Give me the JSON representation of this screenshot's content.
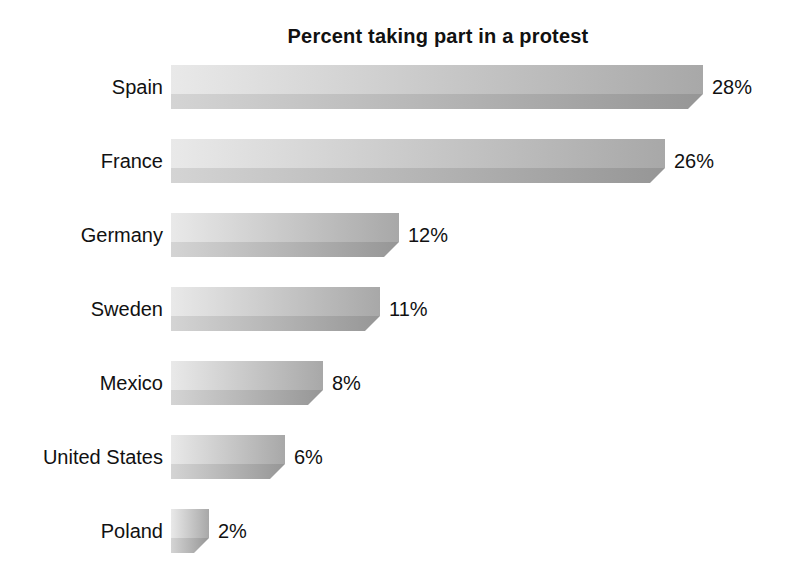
{
  "page": {
    "background_color": "#ffffff",
    "text_color": "#111111"
  },
  "chart_data": {
    "type": "bar",
    "orientation": "horizontal",
    "title": "Percent taking part in a protest",
    "categories": [
      "Spain",
      "France",
      "Germany",
      "Sweden",
      "Mexico",
      "United States",
      "Poland"
    ],
    "values": [
      28,
      26,
      12,
      11,
      8,
      6,
      2
    ],
    "value_suffix": "%",
    "xlabel": "",
    "ylabel": "",
    "xlim": [
      0,
      30
    ],
    "grid": false,
    "legend": false,
    "data_labels": [
      "28%",
      "26%",
      "12%",
      "11%",
      "8%",
      "6%",
      "2%"
    ],
    "bar_style": {
      "top_face_left_color": "#e9e9e9",
      "top_face_right_color": "#a8a8a8",
      "bottom_face_left_color": "#d4d4d4",
      "bottom_face_right_color": "#969696",
      "effect": "3d-chamfer-bottom-right"
    }
  }
}
